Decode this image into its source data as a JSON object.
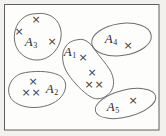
{
  "diagram": {
    "type": "set-diagram",
    "page_color": "#f3f1ed",
    "paper_color": "#fdfdfc",
    "frame_color": "#5f5f5f",
    "outline_color": "#6e6e6e",
    "label_color": "#2b2b2b",
    "mark_symbol": "×",
    "mark_color": "#3d3d3d",
    "sets": [
      {
        "name": "A1",
        "label_base": "A",
        "label_sub": "1",
        "label_pos": {
          "x": 70,
          "y": 53
        },
        "marks": [
          {
            "x": 83,
            "y": 58
          },
          {
            "x": 92,
            "y": 73
          },
          {
            "x": 89,
            "y": 85
          },
          {
            "x": 99,
            "y": 85
          }
        ]
      },
      {
        "name": "A2",
        "label_base": "A",
        "label_sub": "2",
        "label_pos": {
          "x": 52,
          "y": 90
        },
        "marks": [
          {
            "x": 33,
            "y": 82
          },
          {
            "x": 26,
            "y": 93
          },
          {
            "x": 36,
            "y": 93
          }
        ]
      },
      {
        "name": "A3",
        "label_base": "A",
        "label_sub": "3",
        "label_pos": {
          "x": 31,
          "y": 43
        },
        "marks": [
          {
            "x": 36,
            "y": 20
          },
          {
            "x": 19,
            "y": 32
          },
          {
            "x": 52,
            "y": 42
          }
        ]
      },
      {
        "name": "A4",
        "label_base": "A",
        "label_sub": "4",
        "label_pos": {
          "x": 111,
          "y": 40
        },
        "marks": [
          {
            "x": 128,
            "y": 46
          }
        ]
      },
      {
        "name": "A5",
        "label_base": "A",
        "label_sub": "5",
        "label_pos": {
          "x": 113,
          "y": 108
        },
        "marks": [
          {
            "x": 133,
            "y": 101
          }
        ]
      }
    ]
  }
}
